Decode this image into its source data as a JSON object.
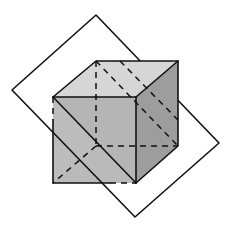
{
  "figure": {
    "colors": {
      "background": "#ffffff",
      "plane": "#e2e2e2",
      "cube_front_face": "#b5b5b5",
      "cube_right_face": "#9d9d9d",
      "cube_top_face": "#d6d6d6",
      "cube_behind_plane": "#bababa",
      "edge": "#111111"
    },
    "plane": {
      "points": "96,15 12,90 135,217 219,143"
    },
    "cube": {
      "front_face": "53,97 136,97 136,183 53,183",
      "back_face": "96,61 178,61 178,146 96,146"
    }
  }
}
